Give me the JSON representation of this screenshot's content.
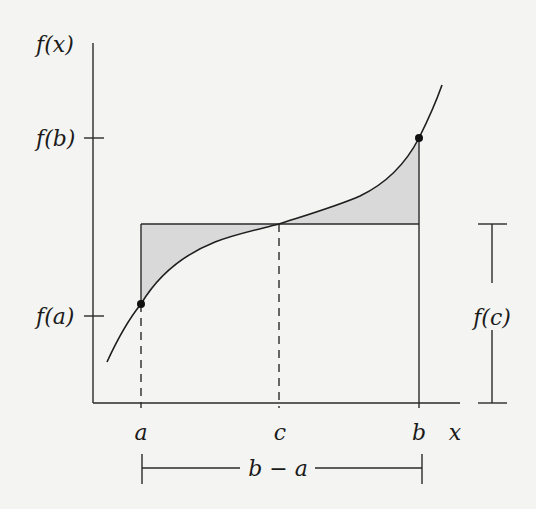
{
  "diagram": {
    "colors": {
      "background": "#f4f4f2",
      "stroke": "#2a2a2a",
      "shade": "#d9d9d9"
    },
    "axes": {
      "y_label": "f(x)",
      "x_label": "x"
    },
    "y_ticks": [
      {
        "label": "f(b)"
      },
      {
        "label": "f(a)"
      }
    ],
    "x_ticks": [
      {
        "label": "a"
      },
      {
        "label": "c"
      },
      {
        "label": "b"
      }
    ],
    "brackets": {
      "height_label": "f(c)",
      "width_label": "b − a"
    },
    "points": [
      {
        "name": "point-a",
        "label": "(a, f(a))"
      },
      {
        "name": "point-b",
        "label": "(b, f(b))"
      }
    ]
  }
}
